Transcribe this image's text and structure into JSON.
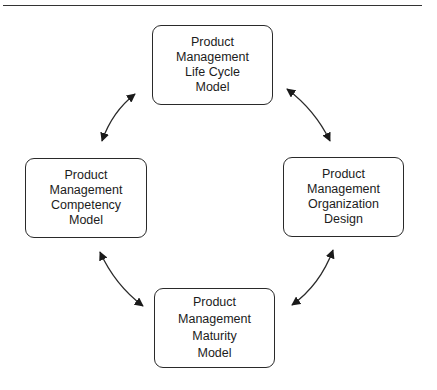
{
  "diagram": {
    "title": "",
    "nodes": {
      "top": {
        "lines": [
          "Product",
          "Management",
          "Life Cycle",
          "Model"
        ]
      },
      "left": {
        "lines": [
          "Product",
          "Management",
          "Competency",
          "Model"
        ]
      },
      "right": {
        "lines": [
          "Product",
          "Management",
          "Organization",
          "Design"
        ]
      },
      "bottom": {
        "lines": [
          "Product",
          "Management",
          "Maturity",
          "Model"
        ]
      }
    },
    "edges": [
      {
        "from": "left",
        "to": "top",
        "type": "bidirectional"
      },
      {
        "from": "top",
        "to": "right",
        "type": "bidirectional"
      },
      {
        "from": "right",
        "to": "bottom",
        "type": "bidirectional"
      },
      {
        "from": "bottom",
        "to": "left",
        "type": "bidirectional"
      }
    ],
    "colors": {
      "stroke": "#2a2a2a",
      "background": "#ffffff"
    }
  }
}
